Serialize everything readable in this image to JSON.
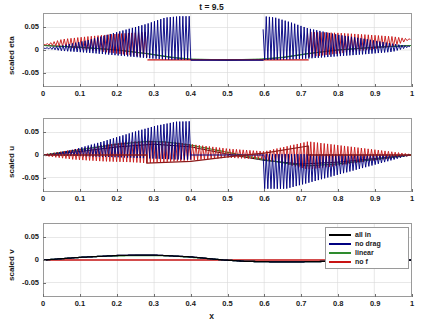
{
  "figure": {
    "title": "t = 9.5",
    "xlabel": "x"
  },
  "legend": {
    "entries": [
      {
        "label": "all in",
        "color": "#000000"
      },
      {
        "label": "no drag",
        "color": "#000080"
      },
      {
        "label": "linear",
        "color": "#2E8B2E"
      },
      {
        "label": "no f",
        "color": "#C81414"
      }
    ]
  },
  "axes": {
    "xticks": [
      "0",
      "0.1",
      "0.2",
      "0.3",
      "0.4",
      "0.5",
      "0.6",
      "0.7",
      "0.8",
      "0.9",
      "1"
    ],
    "xtickvals": [
      0,
      0.1,
      0.2,
      0.3,
      0.4,
      0.5,
      0.6,
      0.7,
      0.8,
      0.9,
      1
    ],
    "yticks": [
      "0.05",
      "0",
      "-0.05"
    ],
    "ytickvals": [
      0.05,
      0,
      -0.05
    ],
    "xlim": [
      0,
      1
    ],
    "ylim": [
      -0.08,
      0.08
    ]
  },
  "panels": [
    {
      "ylabel": "scaled eta"
    },
    {
      "ylabel": "scaled u"
    },
    {
      "ylabel": "scaled v"
    }
  ],
  "chart_data": {
    "type": "line",
    "title": "t = 9.5",
    "xlabel": "x",
    "xlim": [
      0,
      1
    ],
    "ylim": [
      -0.08,
      0.08
    ],
    "xticks": [
      0,
      0.1,
      0.2,
      0.3,
      0.4,
      0.5,
      0.6,
      0.7,
      0.8,
      0.9,
      1
    ],
    "yticks": [
      0.05,
      0,
      -0.05
    ],
    "grid": true,
    "legend_position": "panel-3-upper-right",
    "legend_entries": [
      "all in",
      "no drag",
      "linear",
      "no f"
    ],
    "series_colors": {
      "all in": "#000000",
      "no drag": "#000080",
      "linear": "#2E8B2E",
      "no f": "#C81414"
    },
    "panels": [
      {
        "ylabel": "scaled eta",
        "description": "High-frequency oscillatory wave packets. Navy 'no drag' oscillations grow from x=0 toward x=0.4 reaching amplitude ~0.075 near x=0.33-0.4; red 'no f' oscillations span x=0 to x=0.28 with amplitude ~0.03 and again from x=0.72 to x=1. Flat plateau near -0.022 between x=0.40 and x=0.59 for all curves.",
        "series": [
          {
            "name": "no drag",
            "envelope_upper_x": [
              0,
              0.05,
              0.12,
              0.2,
              0.28,
              0.33,
              0.37,
              0.4,
              0.4,
              0.59,
              0.6,
              0.63,
              0.67,
              0.72,
              0.8,
              0.88,
              0.95,
              1.0
            ],
            "envelope_upper_y": [
              0.004,
              0.01,
              0.022,
              0.04,
              0.058,
              0.072,
              0.075,
              0.075,
              -0.022,
              -0.022,
              0.075,
              0.072,
              0.062,
              0.048,
              0.034,
              0.024,
              0.014,
              0.008
            ],
            "envelope_lower_x": [
              0,
              0.05,
              0.12,
              0.2,
              0.28,
              0.33,
              0.37,
              0.4,
              0.4,
              0.59,
              0.6,
              0.63,
              0.67,
              0.72,
              0.8,
              0.88,
              0.95,
              1.0
            ],
            "envelope_lower_y": [
              0.004,
              -0.002,
              -0.006,
              -0.012,
              -0.018,
              -0.021,
              -0.022,
              -0.022,
              -0.022,
              -0.022,
              -0.022,
              -0.022,
              -0.021,
              -0.019,
              -0.014,
              -0.009,
              -0.004,
              0.008
            ]
          },
          {
            "name": "no f",
            "envelope_upper_x": [
              0,
              0.05,
              0.12,
              0.2,
              0.28,
              0.4,
              0.59,
              0.72,
              0.8,
              0.88,
              0.95,
              1.0
            ],
            "envelope_upper_y": [
              0.012,
              0.024,
              0.03,
              0.036,
              0.04,
              -0.022,
              -0.022,
              0.04,
              0.038,
              0.034,
              0.03,
              0.024
            ],
            "envelope_lower_x": [
              0,
              0.05,
              0.12,
              0.2,
              0.28,
              0.4,
              0.59,
              0.72,
              0.8,
              0.88,
              0.95,
              1.0
            ],
            "envelope_lower_y": [
              0.012,
              0.008,
              0.0,
              -0.008,
              -0.016,
              -0.022,
              -0.022,
              -0.016,
              -0.008,
              0.0,
              0.008,
              0.024
            ]
          },
          {
            "name": "linear",
            "x": [
              0,
              0.1,
              0.2,
              0.28,
              0.35,
              0.4,
              0.5,
              0.59,
              0.65,
              0.72,
              0.8,
              0.9,
              1.0
            ],
            "y": [
              0.01,
              0.006,
              0.0,
              -0.008,
              -0.016,
              -0.02,
              -0.022,
              -0.02,
              -0.016,
              -0.008,
              0.0,
              0.006,
              0.01
            ]
          },
          {
            "name": "all in",
            "x": [
              0,
              0.1,
              0.2,
              0.28,
              0.35,
              0.4,
              0.5,
              0.59,
              0.65,
              0.72,
              0.8,
              0.9,
              1.0
            ],
            "y": [
              0.01,
              0.006,
              0.0,
              -0.008,
              -0.017,
              -0.021,
              -0.022,
              -0.021,
              -0.017,
              -0.008,
              0.0,
              0.006,
              0.01
            ]
          }
        ]
      },
      {
        "ylabel": "scaled u",
        "description": "Antisymmetric oscillatory packets about x=0.5. Navy oscillations grow positive from x=0 to x=0.40 reaching ~0.075, vanish in 0.40-0.59, then negative packet from 0.60 to 1.0 reaching ~-0.075. Red packet spans the full domain with amplitude peaking ~0.032 near x=0.28 and mirrored negative near x=0.72. Red step jumps to -0.018 at x=0.28 and to +0.020 at x=0.72.",
        "series": [
          {
            "name": "no drag",
            "envelope_upper_x": [
              0,
              0.08,
              0.16,
              0.24,
              0.3,
              0.36,
              0.4,
              0.4,
              0.59,
              0.6,
              0.7,
              0.8,
              0.9,
              1.0
            ],
            "envelope_upper_y": [
              0.0,
              0.012,
              0.03,
              0.05,
              0.064,
              0.074,
              0.075,
              0.0,
              0.0,
              0.002,
              0.002,
              0.001,
              0.001,
              0.0
            ],
            "envelope_lower_x": [
              0,
              0.08,
              0.16,
              0.24,
              0.3,
              0.36,
              0.4,
              0.4,
              0.59,
              0.6,
              0.66,
              0.72,
              0.8,
              0.9,
              1.0
            ],
            "envelope_lower_y": [
              0.0,
              -0.002,
              -0.004,
              -0.006,
              -0.008,
              -0.01,
              -0.01,
              0.0,
              0.0,
              -0.075,
              -0.075,
              -0.062,
              -0.044,
              -0.022,
              0.0
            ]
          },
          {
            "name": "no f",
            "envelope_upper_x": [
              0,
              0.08,
              0.16,
              0.24,
              0.28,
              0.36,
              0.5,
              0.6,
              0.72,
              0.8,
              0.9,
              1.0
            ],
            "envelope_upper_y": [
              0.002,
              0.012,
              0.022,
              0.03,
              0.032,
              0.028,
              0.014,
              0.008,
              0.03,
              0.022,
              0.012,
              0.002
            ],
            "envelope_lower_x": [
              0,
              0.08,
              0.16,
              0.24,
              0.28,
              0.36,
              0.5,
              0.6,
              0.72,
              0.8,
              0.9,
              1.0
            ],
            "envelope_lower_y": [
              -0.002,
              -0.01,
              -0.014,
              -0.016,
              -0.018,
              -0.014,
              -0.006,
              -0.01,
              -0.032,
              -0.024,
              -0.012,
              -0.002
            ]
          },
          {
            "name": "linear",
            "x": [
              0,
              0.1,
              0.2,
              0.28,
              0.33,
              0.4,
              0.5,
              0.6,
              0.67,
              0.72,
              0.8,
              0.9,
              1.0
            ],
            "y": [
              0.0,
              0.012,
              0.024,
              0.03,
              0.029,
              0.022,
              0.006,
              -0.01,
              -0.02,
              -0.024,
              -0.02,
              -0.01,
              0.0
            ]
          },
          {
            "name": "no f step",
            "x": [
              0,
              0.28,
              0.28,
              0.4,
              0.5,
              0.6,
              0.72,
              0.72,
              1.0
            ],
            "y": [
              0.0,
              0.0,
              -0.018,
              -0.014,
              -0.004,
              0.004,
              0.02,
              0.0,
              0.0
            ]
          },
          {
            "name": "all in",
            "x": [
              0,
              0.1,
              0.2,
              0.3,
              0.4,
              0.5,
              0.6,
              0.7,
              0.8,
              0.9,
              1.0
            ],
            "y": [
              0.0,
              0.008,
              0.018,
              0.024,
              0.018,
              0.002,
              -0.012,
              -0.02,
              -0.016,
              -0.008,
              0.0
            ]
          }
        ]
      },
      {
        "ylabel": "scaled v",
        "description": "Small smooth curves near zero. Black 'all in' and green 'linear' form a broad positive bump peaking ~0.010 around x=0.25-0.30, crossing zero near x=0.49, then a shallow negative trough ~-0.004 around x=0.62-0.75 returning to zero by x=0.9. Navy overlies black. Red 'no f' stays flat at zero across the whole domain.",
        "series": [
          {
            "name": "all in",
            "x": [
              0,
              0.05,
              0.1,
              0.15,
              0.2,
              0.25,
              0.3,
              0.35,
              0.4,
              0.45,
              0.49,
              0.55,
              0.62,
              0.7,
              0.78,
              0.85,
              0.92,
              1.0
            ],
            "y": [
              0.0,
              0.003,
              0.006,
              0.008,
              0.01,
              0.011,
              0.011,
              0.009,
              0.007,
              0.003,
              0.0,
              -0.003,
              -0.004,
              -0.004,
              -0.003,
              -0.002,
              -0.001,
              0.0
            ]
          },
          {
            "name": "no drag",
            "x": [
              0,
              0.05,
              0.1,
              0.15,
              0.2,
              0.25,
              0.3,
              0.35,
              0.4,
              0.45,
              0.49,
              0.55,
              0.62,
              0.7,
              0.78,
              0.85,
              0.92,
              1.0
            ],
            "y": [
              0.0,
              0.003,
              0.006,
              0.008,
              0.01,
              0.011,
              0.011,
              0.009,
              0.007,
              0.003,
              0.0,
              -0.003,
              -0.004,
              -0.004,
              -0.003,
              -0.002,
              -0.001,
              0.0
            ]
          },
          {
            "name": "linear",
            "x": [
              0,
              0.05,
              0.1,
              0.15,
              0.2,
              0.25,
              0.3,
              0.35,
              0.4,
              0.45,
              0.49,
              0.55,
              0.62,
              0.7,
              0.78,
              0.85,
              0.92,
              1.0
            ],
            "y": [
              0.0,
              0.003,
              0.006,
              0.008,
              0.009,
              0.01,
              0.01,
              0.009,
              0.006,
              0.003,
              0.0,
              -0.003,
              -0.004,
              -0.004,
              -0.003,
              -0.002,
              -0.001,
              0.0
            ]
          },
          {
            "name": "no f",
            "x": [
              0,
              0.25,
              0.5,
              0.75,
              1.0
            ],
            "y": [
              0.0,
              0.0,
              0.0,
              0.0,
              0.0
            ]
          }
        ]
      }
    ]
  }
}
